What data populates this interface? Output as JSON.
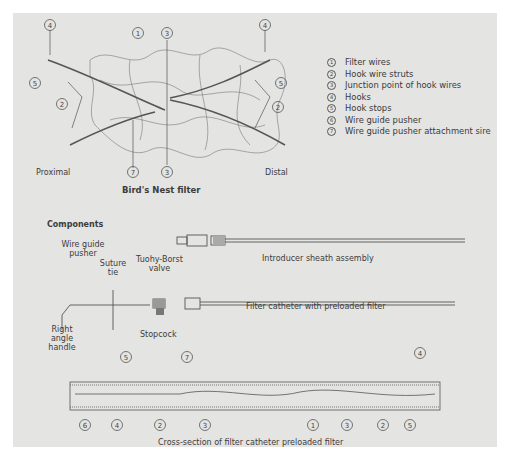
{
  "figure": {
    "title": "Bird's Nest filter",
    "side_labels": {
      "left": "Proximal",
      "right": "Distal"
    },
    "callouts_top": [
      "4",
      "1",
      "3",
      "4",
      "5",
      "5",
      "2",
      "2",
      "7",
      "3"
    ],
    "legend": [
      {
        "num": "1",
        "label": "Filter wires"
      },
      {
        "num": "2",
        "label": "Hook wire struts"
      },
      {
        "num": "3",
        "label": "Junction point of hook wires"
      },
      {
        "num": "4",
        "label": "Hooks"
      },
      {
        "num": "5",
        "label": "Hook stops"
      },
      {
        "num": "6",
        "label": "Wire guide pusher"
      },
      {
        "num": "7",
        "label": "Wire guide pusher attachment sire"
      }
    ]
  },
  "components": {
    "heading": "Components",
    "labels": {
      "wire_guide_pusher": "Wire guide pusher",
      "suture_tie": "Suture tie",
      "tuohy_borst": "Tuohy-Borst valve",
      "introducer": "Introducer sheath assembly",
      "filter_catheter": "Filter catheter with preloaded filter",
      "stopcock": "Stopcock",
      "right_angle_handle": "Right angle handle"
    }
  },
  "cross_section": {
    "caption": "Cross-section of filter catheter preloaded filter",
    "callouts": [
      "5",
      "7",
      "4",
      "6",
      "4",
      "2",
      "3",
      "1",
      "3",
      "2",
      "5"
    ]
  },
  "colors": {
    "panel": "#e4e4e2",
    "line": "#555555",
    "text": "#3a3a3a"
  }
}
